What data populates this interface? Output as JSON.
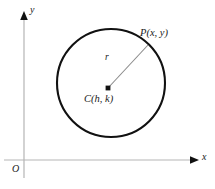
{
  "figure": {
    "type": "geometry-diagram",
    "background_color": "#ffffff"
  },
  "axes": {
    "origin_label": "O",
    "x_axis_label": "x",
    "y_axis_label": "y",
    "color": "#b0b0b0",
    "origin_px": {
      "x": 24,
      "y": 160
    },
    "x_axis": {
      "x1": 4,
      "y1": 160,
      "x2": 196,
      "y2": 160
    },
    "y_axis": {
      "x1": 24,
      "y1": 178,
      "x2": 24,
      "y2": 14
    },
    "arrowhead_color": "#111111"
  },
  "circle": {
    "center_label": "C(h, k)",
    "center_px": {
      "x": 111,
      "y": 83
    },
    "radius_px": 54,
    "stroke_color": "#111111",
    "stroke_width": 2.1,
    "fill": "none"
  },
  "radius": {
    "label": "r",
    "color": "#8a8a8a",
    "stroke_width": 1.1,
    "from_px": {
      "x": 108,
      "y": 88
    },
    "to_px": {
      "x": 148,
      "y": 45
    }
  },
  "points": [
    {
      "name": "center",
      "label": "C(h, k)",
      "marker": "filled-square",
      "px": {
        "x": 108,
        "y": 88
      },
      "color": "#111111"
    },
    {
      "name": "point-on-circle",
      "label": "P(x, y)",
      "marker": "none",
      "px": {
        "x": 148,
        "y": 45
      },
      "color": "#111111"
    }
  ]
}
